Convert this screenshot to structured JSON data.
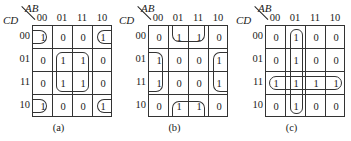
{
  "axis": {
    "col_var": "AB",
    "row_var": "CD"
  },
  "col_headers": [
    "00",
    "01",
    "11",
    "10"
  ],
  "row_headers": [
    "00",
    "01",
    "11",
    "10"
  ],
  "maps": [
    {
      "label": "(a)",
      "cells": [
        [
          "1",
          "0",
          "0",
          "1"
        ],
        [
          "0",
          "1",
          "1",
          "0"
        ],
        [
          "0",
          "1",
          "1",
          "0"
        ],
        [
          "1",
          "0",
          "0",
          "1"
        ]
      ],
      "groups": [
        "corners: (00,00),(00,10),(10,00),(10,10)",
        "center quad: rows 01-11 x cols 01-11"
      ]
    },
    {
      "label": "(b)",
      "cells": [
        [
          "0",
          "1",
          "1",
          "0"
        ],
        [
          "1",
          "0",
          "0",
          "1"
        ],
        [
          "1",
          "0",
          "0",
          "1"
        ],
        [
          "0",
          "1",
          "1",
          "0"
        ]
      ],
      "groups": [
        "top/bottom wrap: rows 00,10 x cols 01,11",
        "left/right wrap: rows 01,11 x cols 00,10"
      ]
    },
    {
      "label": "(c)",
      "cells": [
        [
          "0",
          "1",
          "0",
          "0"
        ],
        [
          "0",
          "1",
          "0",
          "0"
        ],
        [
          "1",
          "1",
          "1",
          "1"
        ],
        [
          "0",
          "1",
          "0",
          "0"
        ]
      ],
      "groups": [
        "column 01 (all rows)",
        "row 11 (all columns)"
      ]
    }
  ]
}
